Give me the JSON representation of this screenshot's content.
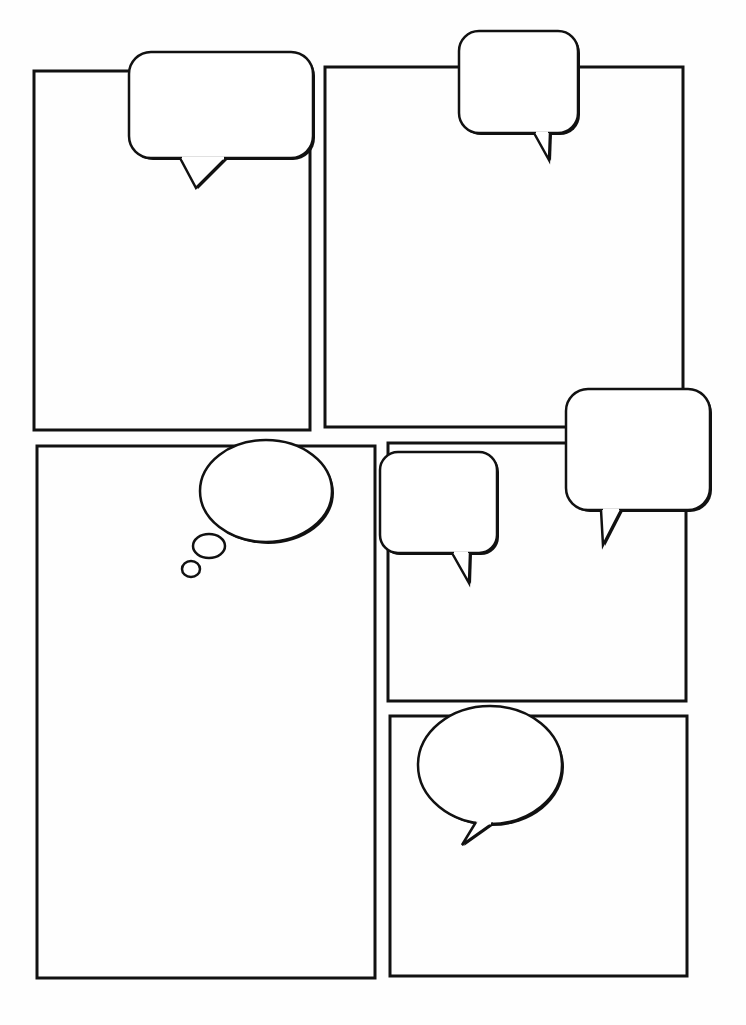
{
  "page": {
    "width": 746,
    "height": 1025,
    "paper_color": "#fefefe",
    "ink_color": "#111111"
  },
  "panels": [
    {
      "id": "panel-1",
      "x": 34,
      "y": 71,
      "w": 276,
      "h": 359
    },
    {
      "id": "panel-2",
      "x": 325,
      "y": 67,
      "w": 358,
      "h": 360
    },
    {
      "id": "panel-3",
      "x": 37,
      "y": 446,
      "w": 338,
      "h": 532
    },
    {
      "id": "panel-4",
      "x": 388,
      "y": 443,
      "w": 298,
      "h": 258
    },
    {
      "id": "panel-5",
      "x": 390,
      "y": 716,
      "w": 297,
      "h": 260
    }
  ],
  "bubbles": [
    {
      "id": "speech-bubble-1",
      "kind": "rounded",
      "x": 129,
      "y": 52,
      "w": 184,
      "h": 106,
      "r": 22,
      "tail": [
        [
          180,
          158
        ],
        [
          196,
          188
        ],
        [
          226,
          158
        ]
      ]
    },
    {
      "id": "speech-bubble-2",
      "kind": "rounded",
      "x": 459,
      "y": 31,
      "w": 119,
      "h": 102,
      "r": 20,
      "tail": [
        [
          534,
          133
        ],
        [
          549,
          160
        ],
        [
          550,
          133
        ]
      ]
    },
    {
      "id": "speech-bubble-3",
      "kind": "rounded",
      "x": 566,
      "y": 389,
      "w": 144,
      "h": 121,
      "r": 22,
      "tail": [
        [
          601,
          510
        ],
        [
          603,
          545
        ],
        [
          621,
          510
        ]
      ]
    },
    {
      "id": "speech-bubble-4",
      "kind": "rounded",
      "x": 380,
      "y": 452,
      "w": 117,
      "h": 101,
      "r": 18,
      "tail": [
        [
          452,
          553
        ],
        [
          469,
          583
        ],
        [
          470,
          553
        ]
      ]
    },
    {
      "id": "speech-bubble-5",
      "kind": "oval",
      "cx": 490,
      "cy": 765,
      "rx": 72,
      "ry": 59,
      "tail": [
        [
          476,
          822
        ],
        [
          462,
          845
        ],
        [
          493,
          823
        ]
      ]
    }
  ],
  "thought_bubble": {
    "id": "thought-bubble",
    "main": {
      "cx": 266,
      "cy": 491,
      "rx": 66,
      "ry": 51
    },
    "dots": [
      {
        "cx": 209,
        "cy": 546,
        "rx": 16,
        "ry": 12
      },
      {
        "cx": 191,
        "cy": 569,
        "rx": 9,
        "ry": 8
      }
    ]
  }
}
